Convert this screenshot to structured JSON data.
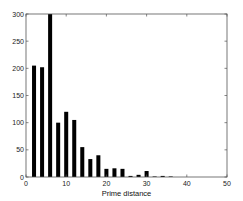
{
  "chart_data": {
    "type": "bar",
    "title": "",
    "xlabel": "Prime distance",
    "ylabel": "",
    "xlim": [
      0,
      50
    ],
    "ylim": [
      0,
      300
    ],
    "xticks": [
      0,
      10,
      20,
      30,
      40,
      50
    ],
    "yticks": [
      0,
      50,
      100,
      150,
      200,
      250,
      300
    ],
    "grid": false,
    "legend": null,
    "bar_color": "#000000",
    "bar_width": 1,
    "categories": [
      2,
      4,
      6,
      8,
      10,
      12,
      14,
      16,
      18,
      20,
      22,
      24,
      26,
      28,
      30,
      32,
      34,
      36
    ],
    "values": [
      205,
      202,
      300,
      100,
      120,
      105,
      55,
      33,
      40,
      15,
      16,
      15,
      2,
      4,
      11,
      1,
      2,
      1
    ]
  }
}
